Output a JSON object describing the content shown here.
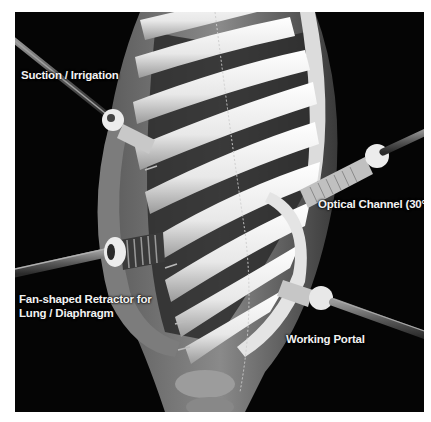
{
  "image": {
    "description": "Grayscale photo of thoracic skeleton model with thoracoscopic instruments inserted through intercostal spaces",
    "colors": {
      "background": "#050505",
      "border": "#ffffff",
      "label_text": "#f2f2f2",
      "rib": "#eeeeee",
      "rod": "#6a6a6a"
    }
  },
  "labels": {
    "suction": "Suction / Irrigation",
    "optical": "Optical Channel (30°)",
    "retractor": "Fan-shaped Retractor for\nLung / Diaphragm",
    "working": "Working Portal"
  },
  "instruments": [
    {
      "name": "suction-irrigation",
      "label_ref": "suction"
    },
    {
      "name": "optical-channel",
      "label_ref": "optical",
      "angle": "30°"
    },
    {
      "name": "fan-shaped-retractor",
      "label_ref": "retractor"
    },
    {
      "name": "working-portal",
      "label_ref": "working"
    }
  ]
}
